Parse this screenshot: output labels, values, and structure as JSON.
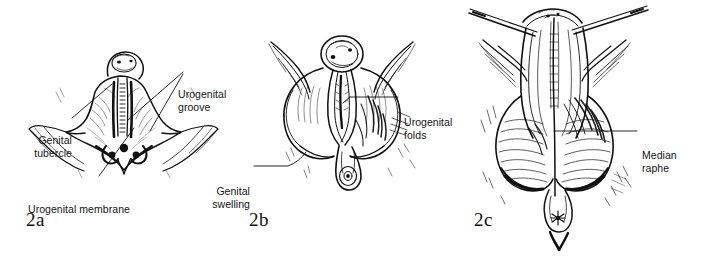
{
  "figure": {
    "background_color": "#ffffff",
    "ink_color": "#111111",
    "panel_count": 3
  },
  "panels": [
    {
      "id": "2a",
      "number_label": "2a",
      "labels": {
        "genital_tubercle": "Genital\ntubercle",
        "urogenital_groove": "Urogenital\ngroove",
        "urogenital_membrane": "Urogenital membrane"
      }
    },
    {
      "id": "2b",
      "number_label": "2b",
      "labels": {
        "urogenital_folds": "Urogenital\nfolds",
        "genital_swelling": "Genital\nswelling"
      }
    },
    {
      "id": "2c",
      "number_label": "2c",
      "labels": {
        "median_raphe": "Median\nraphe"
      }
    }
  ]
}
